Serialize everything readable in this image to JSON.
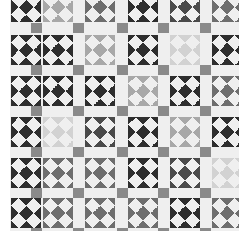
{
  "image": {
    "subject": "Black-and-white photograph of a pieced quilt with pinwheel blocks and gray sashing squares",
    "background": "#ffffff",
    "fabric": "#efefef",
    "sashing_square_color": "#8a8a8a"
  },
  "quilt": {
    "origin": [
      10,
      0
    ],
    "col_x": [
      1,
      33,
      75,
      118,
      160,
      202
    ],
    "row_y": [
      -8,
      35,
      76,
      117,
      158,
      198
    ],
    "sash_x": [
      21,
      63,
      107,
      148,
      190
    ],
    "sash_y": [
      23,
      65,
      106,
      147,
      188,
      228
    ],
    "tones": {
      "dark": "#2e2e2e",
      "mdark": "#4a4a4a",
      "medium": "#6e6e6e",
      "light": "#a8a8a8",
      "vlight": "#d2d2d2"
    },
    "rows": [
      [
        "dark",
        "light",
        "medium",
        "dark",
        "mdark",
        "medium"
      ],
      [
        "dark",
        "dark",
        "light",
        "dark",
        "vlight",
        "dark"
      ],
      [
        "dark",
        "dark",
        "dark",
        "light",
        "dark",
        "medium"
      ],
      [
        "dark",
        "vlight",
        "mdark",
        "dark",
        "light",
        "dark"
      ],
      [
        "dark",
        "medium",
        "medium",
        "dark",
        "mdark",
        "vlight"
      ],
      [
        "dark",
        "medium",
        "medium",
        "medium",
        "dark",
        "medium"
      ]
    ]
  }
}
